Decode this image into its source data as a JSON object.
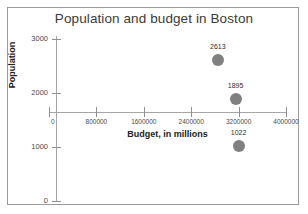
{
  "chart_data": {
    "type": "scatter",
    "title": "Population and budget in Boston",
    "xlabel": "Budget, in millions",
    "ylabel": "Population",
    "xlim": [
      0,
      4000000
    ],
    "ylim": [
      0,
      3000
    ],
    "grid": false,
    "legend": "none",
    "marker_color": "#808080",
    "x_ticks": [
      {
        "value": 0,
        "label": "0"
      },
      {
        "value": 800000,
        "label": "800000"
      },
      {
        "value": 1600000,
        "label": "1600000"
      },
      {
        "value": 2400000,
        "label": "2400000"
      },
      {
        "value": 3200000,
        "label": "3200000"
      },
      {
        "value": 4000000,
        "label": "4000000"
      }
    ],
    "y_ticks": [
      {
        "value": 3000,
        "label": "3000"
      },
      {
        "value": 2000,
        "label": "2000"
      },
      {
        "value": 1000,
        "label": "1000"
      },
      {
        "value": 0,
        "label": "0"
      }
    ],
    "points": [
      {
        "x": 2850000,
        "y": 2613,
        "label": "2613"
      },
      {
        "x": 3150000,
        "y": 1895,
        "label": "1895"
      },
      {
        "x": 3200000,
        "y": 1022,
        "label": "1022"
      }
    ]
  }
}
